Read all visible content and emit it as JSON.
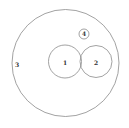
{
  "diagram": {
    "type": "nested-circles",
    "stroke_color": "#8a8a8a",
    "label_color": "#333333",
    "circles": [
      {
        "id": "3",
        "label": "3",
        "cx": 65.5,
        "cy": 63,
        "r": 53.5,
        "label_x": 17,
        "label_y": 67
      },
      {
        "id": "1",
        "label": "1",
        "cx": 65,
        "cy": 61.5,
        "r": 16.5,
        "label_x": 65,
        "label_y": 65
      },
      {
        "id": "2",
        "label": "2",
        "cx": 96,
        "cy": 61.5,
        "r": 16,
        "label_x": 96,
        "label_y": 65
      },
      {
        "id": "4",
        "label": "4",
        "cx": 84,
        "cy": 34,
        "r": 5,
        "label_x": 84,
        "label_y": 36
      }
    ]
  }
}
